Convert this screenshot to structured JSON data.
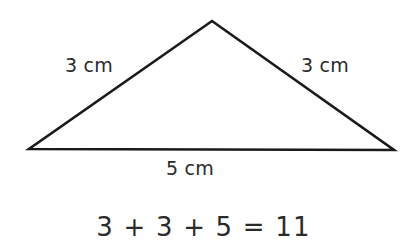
{
  "canvas": {
    "width": 407,
    "height": 251,
    "background_color": "#ffffff"
  },
  "figure": {
    "name": "isosceles-triangle",
    "stroke_color": "#1a1a1a",
    "stroke_width": 2.6,
    "fill": "none",
    "vertices": {
      "apex": {
        "x": 212,
        "y": 21
      },
      "bottom_left": {
        "x": 29,
        "y": 149
      },
      "bottom_right": {
        "x": 394,
        "y": 150
      }
    }
  },
  "labels": {
    "left_side": "3 cm",
    "right_side": "3 cm",
    "base": "5 cm",
    "text_color": "#2b2b2b"
  },
  "equation": {
    "text": "3 + 3 + 5 = 11",
    "terms": [
      3,
      3,
      5
    ],
    "result": 11,
    "text_color": "#2b2b2b"
  }
}
